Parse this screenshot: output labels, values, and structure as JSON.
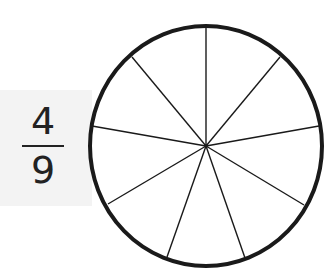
{
  "fraction": {
    "numerator": "4",
    "denominator": "9"
  },
  "circle": {
    "parts": 9,
    "shaded_parts": 0,
    "stroke_color": "#1a1a1a",
    "panel_color": "#f3f3f3"
  }
}
